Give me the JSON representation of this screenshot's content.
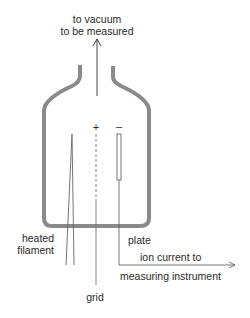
{
  "diagram": {
    "type": "ionization-gauge-schematic",
    "colors": {
      "bulb": "#8a8a8a",
      "wire": "#555555",
      "text": "#2a2a2a",
      "background": "#ffffff"
    },
    "labels": {
      "top_line1": "to vacuum",
      "top_line2": "to be measured",
      "plus_sign": "+",
      "minus_sign": "–",
      "heated_line1": "heated",
      "heated_line2": "filament",
      "plate": "plate",
      "ion_line1": "ion current to",
      "ion_line2": "measuring instrument",
      "grid": "grid"
    },
    "components": [
      {
        "id": "glass-bulb",
        "description": "glass envelope with narrow neck at top"
      },
      {
        "id": "inlet-arrow",
        "description": "arrow pointing up out of neck toward vacuum"
      },
      {
        "id": "heated-filament",
        "description": "V-shaped filament wire"
      },
      {
        "id": "grid",
        "description": "dashed grid electrode, positive"
      },
      {
        "id": "plate",
        "description": "collector plate electrode, negative"
      },
      {
        "id": "ion-current-arrow",
        "description": "arrow from plate lead to measuring instrument"
      }
    ]
  }
}
